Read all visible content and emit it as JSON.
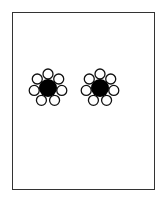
{
  "figure": {
    "frame": {
      "x": 12,
      "y": 12,
      "width": 143,
      "height": 178,
      "stroke": "#333333"
    },
    "clusters": [
      {
        "name": "left-cluster",
        "cx": 48,
        "cy": 88,
        "core_radius": 9,
        "core_fill": "#000000",
        "satellite_count": 7,
        "satellite_radius": 5,
        "satellite_distance": 14
      },
      {
        "name": "right-cluster",
        "cx": 100,
        "cy": 88,
        "core_radius": 9,
        "core_fill": "#000000",
        "satellite_count": 7,
        "satellite_radius": 5,
        "satellite_distance": 14
      }
    ]
  }
}
